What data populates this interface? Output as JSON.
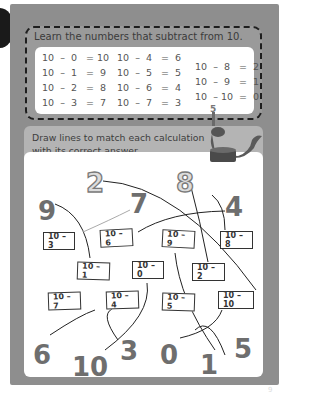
{
  "learn": {
    "title": "Learn the numbers that subtract from 10.",
    "columns": [
      [
        "10  –  0   = 10",
        "10  –  1   =  9",
        "10  –  2   =  8",
        "10  –  3   =  7"
      ],
      [
        "10  –  4   =  6",
        "10  –  5   =  5",
        "10  –  6   =  4",
        "10  –  7   =  3"
      ],
      [
        "10  –  8   =  2",
        "10  –  9   =  1",
        "10  – 10  =  0"
      ]
    ]
  },
  "activity": {
    "instruction_line1": "Draw lines to match each calculation",
    "instruction_line2": "with its correct answer.",
    "answers": [
      "9",
      "2",
      "7",
      "8",
      "4",
      "6",
      "10",
      "3",
      "0",
      "1",
      "5"
    ],
    "cards": [
      "10 – 3",
      "10 – 6",
      "10 – 9",
      "10 – 8",
      "10 – 1",
      "10 – 0",
      "10 – 2",
      "10 – 7",
      "10 – 4",
      "10 – 5",
      "10 – 10"
    ]
  },
  "page_number": "9",
  "colors": {
    "page_border": "#8e8e8e",
    "dash_border": "#1e1e1e",
    "instruction_band": "#b4b4b4",
    "number_fill": "#6e6e6e"
  }
}
